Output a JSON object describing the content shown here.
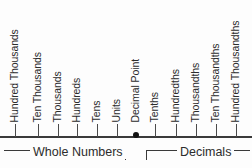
{
  "figure": {
    "background_color": "#fdfdfd",
    "line_color": "#3a3a3a",
    "text_color": "#2c2c2c"
  },
  "number_line": {
    "axis_y": 136,
    "decimal_point_x": 136,
    "positions": [
      {
        "id": "hundred-thousands",
        "label": "Hundred Thousands",
        "x": 15,
        "side": "whole"
      },
      {
        "id": "ten-thousands",
        "label": "Ten Thousands",
        "x": 38,
        "side": "whole"
      },
      {
        "id": "thousands",
        "label": "Thousands",
        "x": 58,
        "side": "whole"
      },
      {
        "id": "hundreds",
        "label": "Hundreds",
        "x": 77,
        "side": "whole"
      },
      {
        "id": "tens",
        "label": "Tens",
        "x": 97,
        "side": "whole"
      },
      {
        "id": "units",
        "label": "Units",
        "x": 117,
        "side": "whole"
      },
      {
        "id": "decimal-point",
        "label": "Decimal Point",
        "x": 136,
        "side": "point"
      },
      {
        "id": "tenths",
        "label": "Tenths",
        "x": 155,
        "side": "decimal"
      },
      {
        "id": "hundredths",
        "label": "Hundredths",
        "x": 176,
        "side": "decimal"
      },
      {
        "id": "thousandths",
        "label": "Thousandths",
        "x": 196,
        "side": "decimal"
      },
      {
        "id": "ten-thousandths",
        "label": "Ten Thousandths",
        "x": 216,
        "side": "decimal"
      },
      {
        "id": "hundred-thousandths",
        "label": "Hundred Thousandths",
        "x": 236,
        "side": "decimal"
      }
    ]
  },
  "groups": [
    {
      "id": "whole-numbers",
      "label": "Whole Numbers",
      "start_x": 4,
      "end_x": 125,
      "label_x": 30
    },
    {
      "id": "decimals",
      "label": "Decimals",
      "start_x": 146,
      "end_x": 249,
      "label_x": 177
    }
  ]
}
